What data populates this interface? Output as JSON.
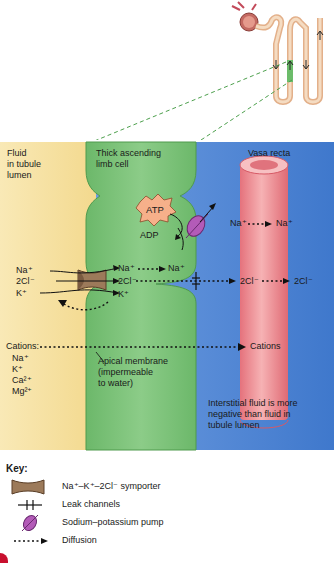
{
  "diagram": {
    "title_regions": {
      "lumen": "Fluid\nin tubule\nlumen",
      "cell": "Thick ascending\nlimb cell",
      "vasa": "Vasa recta"
    },
    "labels": {
      "atp": "ATP",
      "adp": "ADP",
      "na_left": "Na⁺",
      "cl_left": "2Cl⁻",
      "k_left": "K⁺",
      "na_mid": "Na⁺",
      "na_mid2": "Na⁺",
      "cl_mid": "2Cl⁻",
      "k_mid": "K⁺",
      "na_out": "Na⁺",
      "na_vasa": "Na⁺",
      "cl_out": "2Cl⁻",
      "cl_vasa": "2Cl⁻",
      "cations_label": "Cations:",
      "cation_na": "Na⁺",
      "cation_k": "K⁺",
      "cation_ca": "Ca²⁺",
      "cation_mg": "Mg²⁺",
      "cations_vasa": "Cations",
      "apical_membrane": "Apical membrane\n(impermeable\nto water)",
      "interstitial_note": "Interstitial fluid is more\nnegative than fluid in\ntubule lumen"
    },
    "colors": {
      "lumen_bg": "#f7e3a6",
      "interstitial_bg": "#5a8fd6",
      "cell_fill": "#7cc07a",
      "vessel_fill": "#ef8f95",
      "pump_fill": "#b35bb8",
      "symporter_fill": "#9c7a5a",
      "atp_fill": "#f6b08a"
    }
  },
  "key": {
    "title": "Key:",
    "items": [
      {
        "icon": "symporter-icon",
        "label": "Na⁺–K⁺–2Cl⁻ symporter"
      },
      {
        "icon": "leak-channel-icon",
        "label": "Leak channels"
      },
      {
        "icon": "pump-icon",
        "label": "Sodium–potassium pump"
      },
      {
        "icon": "diffusion-arrow-icon",
        "label": "Diffusion"
      }
    ]
  }
}
